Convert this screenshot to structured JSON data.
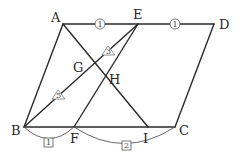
{
  "diagram": {
    "type": "parallelogram-ratio-figure",
    "points": {
      "A": {
        "label": "A",
        "x": 63,
        "y": 24
      },
      "E": {
        "label": "E",
        "x": 138,
        "y": 24
      },
      "D": {
        "label": "D",
        "x": 214,
        "y": 24
      },
      "B": {
        "label": "B",
        "x": 24,
        "y": 127
      },
      "F": {
        "label": "F",
        "x": 74,
        "y": 127
      },
      "I": {
        "label": "I",
        "x": 148,
        "y": 127
      },
      "C": {
        "label": "C",
        "x": 175,
        "y": 127
      },
      "G": {
        "label": "G",
        "x": 96,
        "y": 63
      },
      "H": {
        "label": "H",
        "x": 106,
        "y": 77
      }
    },
    "segments": [
      "A-D",
      "B-C",
      "A-B",
      "D-C",
      "B-E",
      "E-F",
      "A-I"
    ],
    "ratio_marks": {
      "AE": {
        "shape": "circle",
        "value": "1"
      },
      "ED": {
        "shape": "circle",
        "value": "1"
      },
      "GE": {
        "shape": "triangle",
        "value": "3"
      },
      "BG": {
        "shape": "triangle",
        "value": "5"
      },
      "BF": {
        "shape": "square",
        "value": "1"
      },
      "FC": {
        "shape": "square",
        "value": "2"
      }
    }
  }
}
